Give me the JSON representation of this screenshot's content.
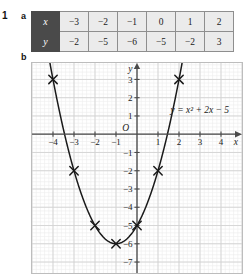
{
  "exercise": {
    "number": "1",
    "part_a_label": "a",
    "part_b_label": "b"
  },
  "table": {
    "row_x_header": "x",
    "row_y_header": "y",
    "x_values": [
      "−3",
      "−2",
      "−1",
      "0",
      "1",
      "2"
    ],
    "y_values": [
      "−2",
      "−5",
      "−6",
      "−5",
      "−2",
      "3"
    ]
  },
  "chart_data": {
    "type": "line",
    "title": "",
    "equation_label": "y = x² + 2x − 5",
    "xlabel": "x",
    "ylabel": "y",
    "origin_label": "O",
    "xlim": [
      -5,
      5
    ],
    "ylim": [
      -7.6,
      3.9
    ],
    "grid": true,
    "minor_grid_per_unit": 5,
    "x_tick_labels": [
      "−4",
      "−3",
      "−2",
      "−1",
      "1",
      "2",
      "3",
      "4"
    ],
    "x_ticks": [
      -4,
      -3,
      -2,
      -1,
      1,
      2,
      3,
      4
    ],
    "y_tick_labels": [
      "3",
      "2",
      "1",
      "−1",
      "−2",
      "−3",
      "−4",
      "−5",
      "−6",
      "−7"
    ],
    "y_ticks": [
      3,
      2,
      1,
      -1,
      -2,
      -3,
      -4,
      -5,
      -6,
      -7
    ],
    "plotted_points": [
      {
        "x": -4,
        "y": 3
      },
      {
        "x": -3,
        "y": -2
      },
      {
        "x": -2,
        "y": -5
      },
      {
        "x": -1,
        "y": -6
      },
      {
        "x": 0,
        "y": -5
      },
      {
        "x": 1,
        "y": -2
      },
      {
        "x": 2,
        "y": 3
      }
    ],
    "marker": "cross",
    "curve": "y = x^2 + 2x - 5",
    "legend_position": "inside-right"
  },
  "colors": {
    "table_header_bg": "#4a4a4a",
    "table_cell_bg": "#ebebeb",
    "grid_major": "#d2d2d2",
    "grid_minor": "#ececec",
    "axis": "#4a4a4a",
    "curve": "#1a1a1a"
  }
}
